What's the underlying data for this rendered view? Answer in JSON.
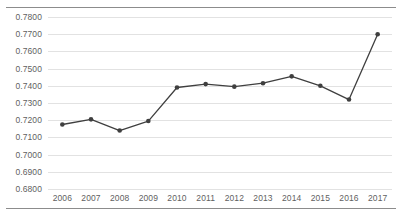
{
  "chart_data": {
    "type": "line",
    "title": "",
    "subtitle": "",
    "xlabel": "",
    "ylabel": "",
    "categories": [
      "2006",
      "2007",
      "2008",
      "2009",
      "2010",
      "2011",
      "2012",
      "2013",
      "2014",
      "2015",
      "2016",
      "2017"
    ],
    "values": [
      0.7175,
      0.7205,
      0.714,
      0.7195,
      0.739,
      0.741,
      0.7395,
      0.7415,
      0.7455,
      0.74,
      0.732,
      0.77
    ],
    "series": [
      {
        "name": "",
        "values": [
          0.7175,
          0.7205,
          0.714,
          0.7195,
          0.739,
          0.741,
          0.7395,
          0.7415,
          0.7455,
          0.74,
          0.732,
          0.77
        ]
      }
    ],
    "ylim": [
      0.68,
      0.78
    ],
    "ytick_step": 0.01,
    "ytick_labels": [
      "0.7800",
      "0.7700",
      "0.7600",
      "0.7500",
      "0.7400",
      "0.7300",
      "0.7200",
      "0.7100",
      "0.7000",
      "0.6900",
      "0.6800"
    ],
    "ytick_values": [
      0.78,
      0.77,
      0.76,
      0.75,
      0.74,
      0.73,
      0.72,
      0.71,
      0.7,
      0.69,
      0.68
    ],
    "xtick_labels": [
      "2006",
      "2007",
      "2008",
      "2009",
      "2010",
      "2011",
      "2012",
      "2013",
      "2014",
      "2015",
      "2016",
      "2017"
    ],
    "grid": true,
    "grid_orientation": "horizontal",
    "legend": false,
    "legend_position": "none",
    "markers": true,
    "marker_shape": "circle",
    "annotations": []
  },
  "style": {
    "line_color": "#3f3f3f",
    "marker_color": "#3f3f3f",
    "grid_color": "#e2e2e2",
    "rule_color": "#8c8c8c",
    "tick_label_color": "#5f5f5f",
    "background": "#ffffff"
  }
}
